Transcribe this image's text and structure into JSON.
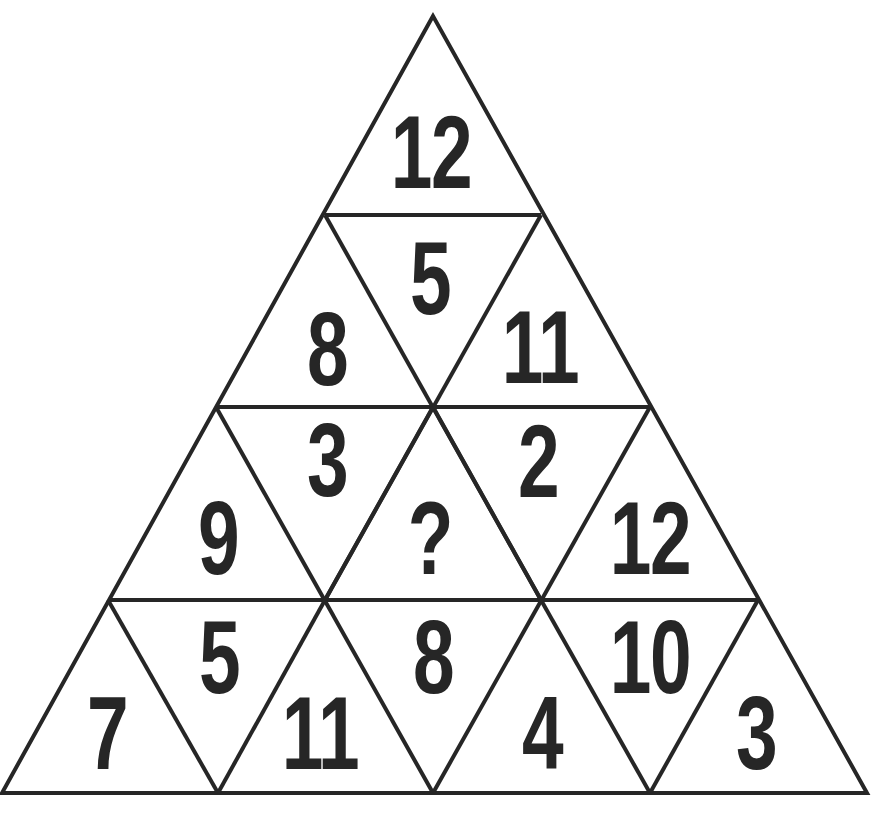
{
  "puzzle": {
    "type": "triangle number puzzle",
    "line_color": "#262626",
    "text_color": "#262626",
    "background": "#ffffff",
    "cells": [
      {
        "id": "r1-up-1",
        "row": 1,
        "orientation": "up",
        "value": "12",
        "x": 431,
        "y": 112
      },
      {
        "id": "r2-down-1",
        "row": 2,
        "orientation": "down",
        "value": "5",
        "x": 430,
        "y": 238
      },
      {
        "id": "r2-up-1",
        "row": 2,
        "orientation": "up",
        "value": "8",
        "x": 327,
        "y": 309
      },
      {
        "id": "r2-up-2",
        "row": 2,
        "orientation": "up",
        "value": "11",
        "x": 540,
        "y": 307
      },
      {
        "id": "r3-down-1",
        "row": 3,
        "orientation": "down",
        "value": "3",
        "x": 327,
        "y": 420
      },
      {
        "id": "r3-down-2",
        "row": 3,
        "orientation": "down",
        "value": "2",
        "x": 538,
        "y": 421
      },
      {
        "id": "r3-up-1",
        "row": 3,
        "orientation": "up",
        "value": "9",
        "x": 218,
        "y": 498
      },
      {
        "id": "r3-up-2",
        "row": 3,
        "orientation": "up",
        "value": "?",
        "x": 430,
        "y": 498
      },
      {
        "id": "r3-up-3",
        "row": 3,
        "orientation": "up",
        "value": "12",
        "x": 650,
        "y": 498
      },
      {
        "id": "r4-down-1",
        "row": 4,
        "orientation": "down",
        "value": "5",
        "x": 219,
        "y": 617
      },
      {
        "id": "r4-down-2",
        "row": 4,
        "orientation": "down",
        "value": "8",
        "x": 433,
        "y": 617
      },
      {
        "id": "r4-down-3",
        "row": 4,
        "orientation": "down",
        "value": "10",
        "x": 650,
        "y": 617
      },
      {
        "id": "r4-up-1",
        "row": 4,
        "orientation": "up",
        "value": "7",
        "x": 107,
        "y": 693
      },
      {
        "id": "r4-up-2",
        "row": 4,
        "orientation": "up",
        "value": "11",
        "x": 320,
        "y": 693
      },
      {
        "id": "r4-up-3",
        "row": 4,
        "orientation": "up",
        "value": "4",
        "x": 542,
        "y": 693
      },
      {
        "id": "r4-up-4",
        "row": 4,
        "orientation": "up",
        "value": "3",
        "x": 756,
        "y": 693
      }
    ]
  }
}
